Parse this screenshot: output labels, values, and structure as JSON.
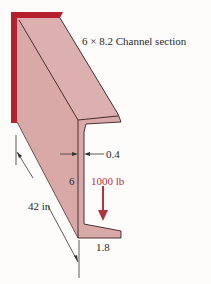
{
  "figure": {
    "title_label": "6 × 8.2 Channel section",
    "dimension_length": "42 in",
    "dimension_thickness": "0.4",
    "dimension_depth": "6",
    "dimension_flange_width": "1.8",
    "load_label": "1000 lb"
  },
  "colors": {
    "wall": "#b5202f",
    "channel_fill": "#d9a9a8",
    "load_arrow": "#b2323f",
    "outline": "#3a2020"
  }
}
